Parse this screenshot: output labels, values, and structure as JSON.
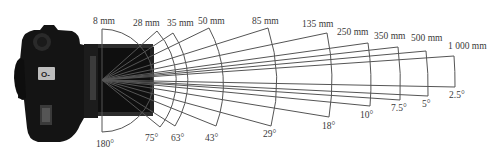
{
  "diagram": {
    "title": "",
    "line_color": "#555555",
    "camera_color": "#141414",
    "vertex": [
      102,
      80
    ],
    "lenses": [
      {
        "focal": "8 mm",
        "angle": "180°",
        "half_deg": 90,
        "end_top": [
          102,
          29
        ],
        "end_bot": [
          102,
          132
        ],
        "r": 51,
        "focal_pos": [
          93,
          17
        ],
        "angle_pos": [
          96,
          140
        ]
      },
      {
        "focal": "28 mm",
        "angle": "75°",
        "half_deg": 41,
        "end_top": [
          157,
          31
        ],
        "end_bot": [
          160,
          127
        ],
        "r": 73,
        "focal_pos": [
          133,
          19
        ],
        "angle_pos": [
          145,
          134
        ]
      },
      {
        "focal": "35 mm",
        "angle": "63°",
        "half_deg": 33,
        "end_top": [
          173,
          33
        ],
        "end_bot": [
          175,
          126
        ],
        "r": 86,
        "focal_pos": [
          167,
          19
        ],
        "angle_pos": [
          171,
          134
        ]
      },
      {
        "focal": "50 mm",
        "angle": "43°",
        "half_deg": 25,
        "end_top": [
          209,
          28
        ],
        "end_bot": [
          216,
          126
        ],
        "r": 119,
        "focal_pos": [
          198,
          17
        ],
        "angle_pos": [
          205,
          134
        ]
      },
      {
        "focal": "85 mm",
        "angle": "29°",
        "half_deg": 17,
        "end_top": [
          268,
          28
        ],
        "end_bot": [
          271,
          126
        ],
        "r": 173,
        "focal_pos": [
          252,
          17
        ],
        "angle_pos": [
          263,
          130
        ]
      },
      {
        "focal": "135 mm",
        "angle": "18°",
        "half_deg": 11,
        "end_top": [
          327,
          33
        ],
        "end_bot": [
          329,
          117
        ],
        "r": 230,
        "focal_pos": [
          302,
          20
        ],
        "angle_pos": [
          322,
          122
        ]
      },
      {
        "focal": "250 mm",
        "angle": "10°",
        "half_deg": 7.2,
        "end_top": [
          368,
          43
        ],
        "end_bot": [
          370,
          106
        ],
        "r": 268,
        "focal_pos": [
          337,
          28
        ],
        "angle_pos": [
          360,
          111
        ]
      },
      {
        "focal": "350 mm",
        "angle": "7.5°",
        "half_deg": 5.3,
        "end_top": [
          398,
          47
        ],
        "end_bot": [
          400,
          100
        ],
        "r": 297,
        "focal_pos": [
          374,
          32
        ],
        "angle_pos": [
          391,
          104
        ]
      },
      {
        "focal": "500 mm",
        "angle": "5°",
        "half_deg": 3.9,
        "end_top": [
          426,
          51
        ],
        "end_bot": [
          428,
          96
        ],
        "r": 325,
        "focal_pos": [
          411,
          34
        ],
        "angle_pos": [
          422,
          100
        ]
      },
      {
        "focal": "1 000 mm",
        "angle": "2.5°",
        "half_deg": 2.7,
        "end_top": [
          454,
          56
        ],
        "end_bot": [
          455,
          87
        ],
        "r": 353,
        "focal_pos": [
          448,
          42
        ],
        "angle_pos": [
          449,
          91
        ]
      }
    ]
  }
}
